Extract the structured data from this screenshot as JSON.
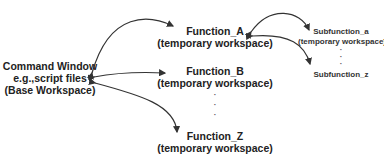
{
  "diagram": {
    "base": {
      "line1": "Command Window",
      "line2": "e.g.,script files",
      "line3": "(Base Workspace)"
    },
    "functions": [
      {
        "name": "Function_A",
        "workspace": "(temporary workspace)"
      },
      {
        "name": "Function_B",
        "workspace": "(temporary workspace)"
      },
      {
        "name": "Function_Z",
        "workspace": "(temporary workspace)"
      }
    ],
    "subfunctions": [
      {
        "name": "Subfunction_a",
        "workspace": "(temporary workspace)"
      },
      {
        "name": "Subfunction_z"
      }
    ],
    "ellipsis": "·",
    "colors": {
      "arrow": "#333333",
      "text": "#222222"
    }
  }
}
